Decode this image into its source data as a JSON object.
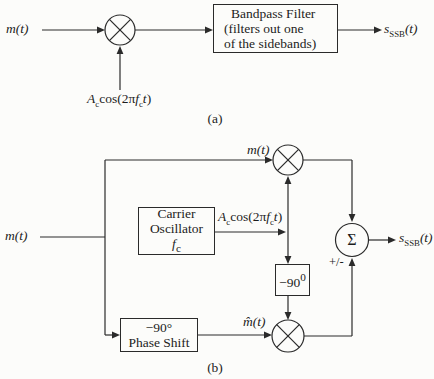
{
  "diagram_a": {
    "caption": "(a)",
    "input": {
      "var": "m",
      "args": "(t)"
    },
    "modulating": {
      "amp": "A",
      "amp_sub": "c",
      "cos": "cos(2π",
      "freq": "f",
      "freq_sub": "c",
      "time": "t",
      "close": ")"
    },
    "bandpass": {
      "line1": "Bandpass Filter",
      "line2": "(filters out one",
      "line3": "of the sidebands)"
    },
    "output": {
      "var": "s",
      "sub": "SSB",
      "args": "(t)"
    }
  },
  "diagram_b": {
    "caption": "(b)",
    "input": {
      "var": "m",
      "args": "(t)"
    },
    "top_branch": {
      "var": "m",
      "args": "(t)"
    },
    "oscillator": {
      "line1": "Carrier",
      "line2": "Oscillator",
      "freq": "f",
      "freq_sub": "c"
    },
    "carrier_out": {
      "amp": "A",
      "amp_sub": "c",
      "cos": "cos(2π",
      "freq": "f",
      "freq_sub": "c",
      "time": "t",
      "close": ")"
    },
    "quad_box": {
      "num": "−90",
      "sup": "0"
    },
    "phase_shift": {
      "line1": "−90°",
      "line2": "Phase Shift"
    },
    "hilbert": {
      "var": "m̂",
      "args": "(t)"
    },
    "summer": {
      "symbol": "Σ",
      "sign": "+/-"
    },
    "output": {
      "var": "s",
      "sub": "SSB",
      "args": "(t)"
    }
  }
}
